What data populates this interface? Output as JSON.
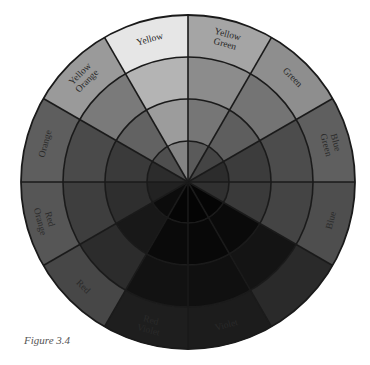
{
  "figure": {
    "caption": "Figure 3.4",
    "center": [
      188,
      182
    ],
    "radii": [
      41,
      83,
      125,
      167
    ],
    "stroke_color": "#1a1a1a",
    "sectors": [
      {
        "name": "Yellow Green",
        "lines": [
          "Yellow",
          "Green"
        ],
        "start": -90,
        "shades": [
          "#a5a5a5",
          "#8c8c8c",
          "#767676",
          "#5a5a5a"
        ]
      },
      {
        "name": "Green",
        "lines": [
          "Green"
        ],
        "start": -60,
        "shades": [
          "#8e8e8e",
          "#747474",
          "#5e5e5e",
          "#444444"
        ]
      },
      {
        "name": "Blue Green",
        "lines": [
          "Blue",
          "Green"
        ],
        "start": -30,
        "shades": [
          "#5f5f5f",
          "#4c4c4c",
          "#3c3c3c",
          "#2c2c2c"
        ]
      },
      {
        "name": "Blue",
        "lines": [
          "Blue"
        ],
        "start": 0,
        "shades": [
          "#4e4e4e",
          "#444444",
          "#3a3a3a",
          "#303030"
        ]
      },
      {
        "name": "Blue Violet",
        "lines": [
          "Blue",
          "Violet"
        ],
        "start": 30,
        "shades": [
          "#2a2a2a",
          "#141414",
          "#0a0a0a",
          "#050505"
        ]
      },
      {
        "name": "Violet",
        "lines": [
          "Violet"
        ],
        "start": 60,
        "shades": [
          "#1c1c1c",
          "#101010",
          "#080808",
          "#040404"
        ]
      },
      {
        "name": "Red Violet",
        "lines": [
          "Red",
          "Violet"
        ],
        "start": 90,
        "shades": [
          "#1e1e1e",
          "#121212",
          "#0a0a0a",
          "#050505"
        ]
      },
      {
        "name": "Red",
        "lines": [
          "Red"
        ],
        "start": 120,
        "shades": [
          "#474747",
          "#2c2c2c",
          "#181818",
          "#0c0c0c"
        ]
      },
      {
        "name": "Red Orange",
        "lines": [
          "Red",
          "Orange"
        ],
        "start": 150,
        "shades": [
          "#565656",
          "#3e3e3e",
          "#2e2e2e",
          "#222222"
        ]
      },
      {
        "name": "Orange",
        "lines": [
          "Orange"
        ],
        "start": 180,
        "shades": [
          "#5e5e5e",
          "#4a4a4a",
          "#3a3a3a",
          "#2c2c2c"
        ]
      },
      {
        "name": "Yellow Orange",
        "lines": [
          "Yellow",
          "Orange"
        ],
        "start": 210,
        "shades": [
          "#9a9a9a",
          "#7a7a7a",
          "#626262",
          "#4e4e4e"
        ]
      },
      {
        "name": "Yellow",
        "lines": [
          "Yellow"
        ],
        "start": 240,
        "shades": [
          "#e6e6e6",
          "#b4b4b4",
          "#9c9c9c",
          "#848484"
        ]
      }
    ]
  }
}
